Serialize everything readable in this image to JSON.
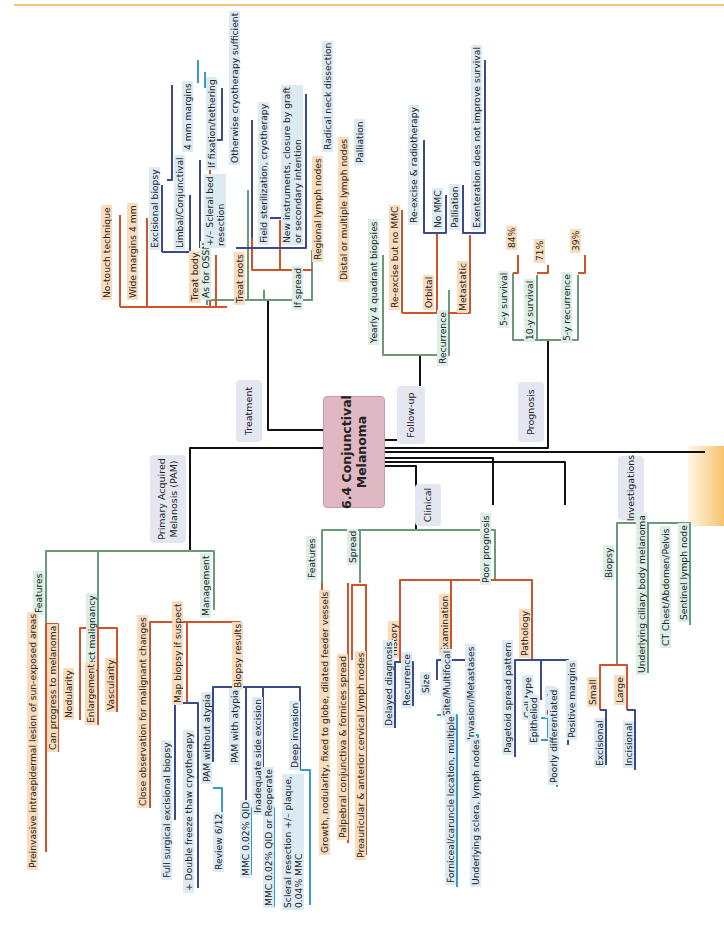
{
  "title": "6.4 Conjunctival\nMelanoma",
  "categories": {
    "treatment": "Treatment",
    "followup": "Follow-up",
    "prognosis": "Prognosis",
    "pam": "Primary Acquired\nMelanosis (PAM)",
    "clinical": "Clinical",
    "investigations": "Investigations"
  },
  "treatment": {
    "as_for_ossn": "As for OSSN",
    "no_touch": "No-touch technique",
    "wide_margins": "Wide margins 4 mm",
    "treat_body": "Treat body",
    "excisional_biopsy": "Excisional biopsy",
    "limbal": "Limbal/Conjunctival",
    "four_mm": "4 mm margins",
    "scleral_bed": "+/– Scleral bed\nresection",
    "fixation": "If fixation/tethering",
    "otherwise_cryo": "Otherwise cryotherapy sufficient",
    "treat_roots": "Treat roots",
    "field_steril": "Field sterilization, cryotherapy",
    "new_instruments": "New instruments, closure by graft\nor secondary intention",
    "if_spread": "If spread",
    "regional_ln": "Regional lymph nodes",
    "radical_neck": "Radical neck dissection",
    "distal_ln": "Distal or multiple lymph nodes",
    "palliation": "Palliation"
  },
  "followup": {
    "yearly": "Yearly 4 quadrant biopsies",
    "recurrence": "Recurrence",
    "reexcise_no_mmc": "Re-excise but no MMC",
    "orbital": "Orbital",
    "reexcise_radio": "Re-excise & radiotherapy",
    "no_mmc": "No MMC",
    "metastatic": "Metastatic",
    "palliation": "Palliation",
    "exenteration": "Exenteration does not improve survival"
  },
  "prognosis": {
    "items": [
      {
        "label": "5-y survival",
        "value": "84%"
      },
      {
        "label": "10-y survival",
        "value": "71%"
      },
      {
        "label": "5-y recurrence",
        "value": "39%"
      }
    ]
  },
  "pam": {
    "features": "Features",
    "preinvasive": "Preinvasive intraepidermal lesion of sun-exposed areas",
    "can_progress": "Can progress to melanoma",
    "suspect": "Suspect malignancy",
    "nodularity": "Nodularity",
    "enlargement": "Enlargement",
    "vascularity": "Vascularity",
    "management": "Management",
    "close_obs": "Close observation for malignant changes",
    "map_biopsy": "Map biopsy if suspect",
    "full_surgical": "Full surgical excisional biopsy",
    "double_freeze": "+ Double freeze thaw cryotherapy",
    "biopsy_results": "Biopsy results",
    "pam_without": "PAM without atypia",
    "review": "Review 6/12",
    "pam_with": "PAM with atypia",
    "mmc_002": "MMC 0.02% QID",
    "inadequate": "Inadequate side excision",
    "mmc_reoperate": "MMC 0.02% QID or Reoperate",
    "deep_invasion": "Deep invasion",
    "scleral_resection": "Scleral resection +/– plaque,\n0.04% MMC"
  },
  "clinical": {
    "features": "Features",
    "growth": "Growth, nodularity, fixed to globe, dilated feeder vessels",
    "spread": "Spread",
    "palpebral": "Palpebral conjunctiva & fornices spread",
    "preauricular": "Preauricular & anterior cervical lymph nodes",
    "poor_prognosis": "Poor prognosis",
    "history": "History",
    "delayed": "Delayed diagnosis",
    "recurrence": "Recurrence",
    "examination": "Examination",
    "size": "Size",
    "site": "Site/Multifocal",
    "forniceal": "Forniceal/caruncle location, multiple",
    "invasion": "Invasion/Metastases",
    "underlying_sclera": "Underlying sclera, lymph nodes",
    "pathology": "Pathology",
    "pagetoid": "Pagetoid spread pattern",
    "cell_type": "Cell type",
    "epitheliod": "Epitheliod",
    "grade": "Grade",
    "poorly_diff": "Poorly differentiated",
    "positive_margins": "Positive margins"
  },
  "investigations": {
    "biopsy": "Biopsy",
    "small": "Small",
    "excisional": "Excisional",
    "large": "Large",
    "incisional": "Incisional",
    "ciliary": "Underlying ciliary body melanoma",
    "ct": "CT Chest/Abdomen/Pelvis",
    "sentinel": "Sentinel lymph node"
  },
  "colors": {
    "orange_line": "#d0532a",
    "green_line": "#6a9a78",
    "navy_line": "#3b4a8c",
    "teal_line": "#3a9bc4",
    "orange_bg": "#f9dcbc",
    "green_bg": "#dcefe6",
    "blue_bg": "#dceaf3",
    "category_bg": "#e4e7f1",
    "center_bg": "#dfb8c3"
  }
}
